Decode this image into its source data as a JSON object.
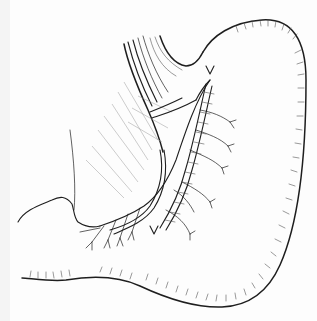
{
  "figure": {
    "style": "black ink line drawing on white",
    "colors": {
      "ink": "#1e1e1e",
      "background": "#fdfdfd",
      "hatch": "#555555"
    },
    "markers": [
      {
        "name": "upper-arrowhead",
        "x": 210,
        "y": 73
      },
      {
        "name": "lower-arrowhead",
        "x": 154,
        "y": 232
      }
    ]
  }
}
